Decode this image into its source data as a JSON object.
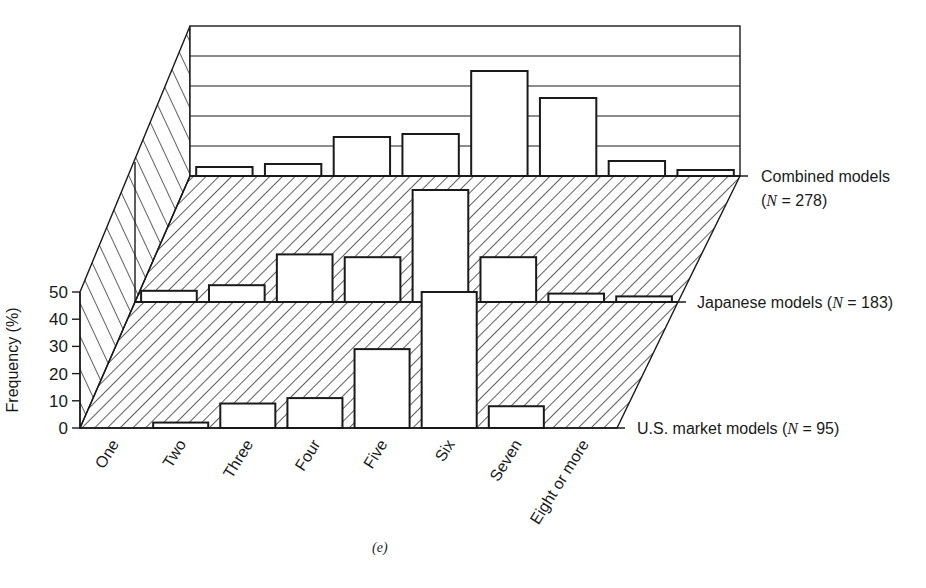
{
  "chart_data": {
    "type": "bar",
    "subtype": "3d-stacked-layers",
    "title": "",
    "xlabel": "",
    "ylabel": "Frequency (%)",
    "ylim": [
      0,
      50
    ],
    "yticks": [
      0,
      10,
      20,
      30,
      40,
      50
    ],
    "grid": true,
    "categories": [
      "One",
      "Two",
      "Three",
      "Four",
      "Five",
      "Six",
      "Seven",
      "Eight or more"
    ],
    "series": [
      {
        "name": "U.S. market models",
        "n_label": "(N = 95)",
        "label_prefix": "U.S. market models (",
        "N": "95",
        "values": [
          0,
          2,
          9,
          11,
          29,
          50,
          8,
          0
        ]
      },
      {
        "name": "Japanese models",
        "n_label": "(N = 183)",
        "label_prefix": "Japanese models (",
        "N": "183",
        "values": [
          4,
          6,
          17,
          16,
          40,
          16,
          3,
          2
        ]
      },
      {
        "name": "Combined models",
        "n_label": "(N = 278)",
        "label_prefix": "Combined models",
        "N": "278",
        "values": [
          3,
          4,
          13,
          14,
          35,
          26,
          5,
          2
        ]
      }
    ],
    "caption": "(e)",
    "colors": {
      "line": "#1a1a1a",
      "bar_fill": "#ffffff",
      "background": "#ffffff"
    }
  }
}
